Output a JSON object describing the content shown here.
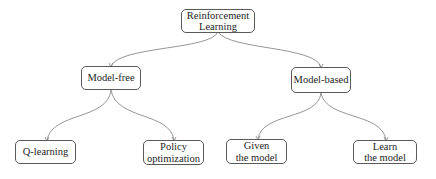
{
  "diagram": {
    "type": "tree",
    "colors": {
      "border": "#5a5a5a",
      "edge": "#8a8a8a",
      "text": "#1e1e1e",
      "background": "#ffffff"
    },
    "nodes": {
      "root": {
        "lines": [
          "Reinforcement",
          "Learning"
        ]
      },
      "model_free": {
        "lines": [
          "Model-free"
        ]
      },
      "model_based": {
        "lines": [
          "Model-based"
        ]
      },
      "q_learning": {
        "lines": [
          "Q-learning"
        ]
      },
      "policy_optimization": {
        "lines": [
          "Policy",
          "optimization"
        ]
      },
      "given_model": {
        "lines": [
          "Given",
          "the model"
        ]
      },
      "learn_model": {
        "lines": [
          "Learn",
          "the model"
        ]
      }
    },
    "edges": [
      {
        "from": "root",
        "to": "model_free"
      },
      {
        "from": "root",
        "to": "model_based"
      },
      {
        "from": "model_free",
        "to": "q_learning"
      },
      {
        "from": "model_free",
        "to": "policy_optimization"
      },
      {
        "from": "model_based",
        "to": "given_model"
      },
      {
        "from": "model_based",
        "to": "learn_model"
      }
    ]
  }
}
